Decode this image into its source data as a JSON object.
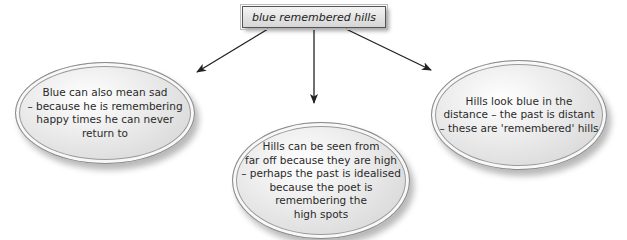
{
  "diagram": {
    "type": "mind-map",
    "central": {
      "label": "blue remembered hills"
    },
    "branches": [
      {
        "id": "left",
        "text": "Blue can also mean sad\n– because he is remembering\nhappy times he can never\nreturn to"
      },
      {
        "id": "center",
        "text": "Hills can be seen from\nfar off because they are high\n– perhaps the past is idealised\nbecause the poet is\nremembering the\nhigh spots"
      },
      {
        "id": "right",
        "text": "Hills look blue in the\ndistance – the past is distant\n– these are 'remembered' hills"
      }
    ],
    "colors": {
      "arrow": "#222222",
      "ellipse_border": "#8a8a8a",
      "ellipse_fill": "#e6e6e6"
    }
  }
}
